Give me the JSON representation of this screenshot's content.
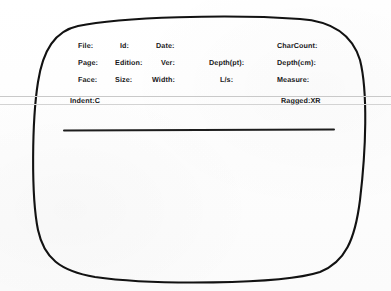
{
  "document": {
    "kind": "scanned-form",
    "ink_color": "#18181a",
    "rule_color": "#c9c9c9",
    "underline_color": "#1d1d1d"
  },
  "form": {
    "rows": [
      {
        "name": "row-identification",
        "fields": [
          {
            "name": "file",
            "label": "File:",
            "x": 78
          },
          {
            "name": "id",
            "label": "Id:",
            "x": 120
          },
          {
            "name": "date",
            "label": "Date:",
            "x": 156
          },
          {
            "name": "charcount",
            "label": "CharCount:",
            "x": 277
          }
        ]
      },
      {
        "name": "row-page",
        "fields": [
          {
            "name": "page",
            "label": "Page:",
            "x": 78
          },
          {
            "name": "edition",
            "label": "Edition:",
            "x": 115
          },
          {
            "name": "ver",
            "label": "Ver:",
            "x": 161
          },
          {
            "name": "depth-pt",
            "label": "Depth(pt):",
            "x": 209
          },
          {
            "name": "depth-cm",
            "label": "Depth(cm):",
            "x": 277
          }
        ]
      },
      {
        "name": "row-typography",
        "fields": [
          {
            "name": "face",
            "label": "Face:",
            "x": 78
          },
          {
            "name": "size",
            "label": "Size:",
            "x": 115
          },
          {
            "name": "width",
            "label": "Width:",
            "x": 152
          },
          {
            "name": "ls",
            "label": "L/s:",
            "x": 220
          },
          {
            "name": "measure",
            "label": "Measure:",
            "x": 277
          }
        ]
      },
      {
        "name": "row-alignment",
        "fields": [
          {
            "name": "indent",
            "label": "Indent:C",
            "x": 70
          },
          {
            "name": "ragged",
            "label": "Ragged:XR",
            "x": 281
          }
        ]
      }
    ]
  }
}
